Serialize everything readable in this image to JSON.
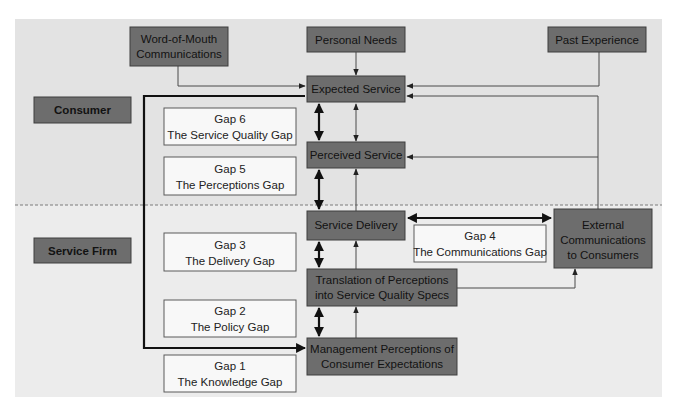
{
  "diagram": {
    "title": "",
    "colors": {
      "consumer_bg": "#e3e3e3",
      "firm_bg": "#ececec",
      "dark_box": "#6d6d6d",
      "light_box": "#f8f8f8"
    },
    "regions": {
      "consumer": "Consumer",
      "service_firm": "Service Firm"
    },
    "influences": {
      "word_of_mouth": [
        "Word-of-Mouth",
        "Communications"
      ],
      "personal_needs": "Personal Needs",
      "past_experience": "Past Experience"
    },
    "nodes": {
      "expected_service": "Expected Service",
      "perceived_service": "Perceived Service",
      "service_delivery": "Service Delivery",
      "translation": [
        "Translation of Perceptions",
        "into Service Quality Specs"
      ],
      "management": [
        "Management Perceptions of",
        "Consumer Expectations"
      ],
      "external_comm": [
        "External",
        "Communications",
        "to Consumers"
      ]
    },
    "gaps": {
      "gap6": [
        "Gap 6",
        "The Service Quality Gap"
      ],
      "gap5": [
        "Gap 5",
        "The Perceptions Gap"
      ],
      "gap4": [
        "Gap 4",
        "The Communications Gap"
      ],
      "gap3": [
        "Gap 3",
        "The Delivery Gap"
      ],
      "gap2": [
        "Gap 2",
        "The Policy Gap"
      ],
      "gap1": [
        "Gap 1",
        "The Knowledge Gap"
      ]
    }
  }
}
